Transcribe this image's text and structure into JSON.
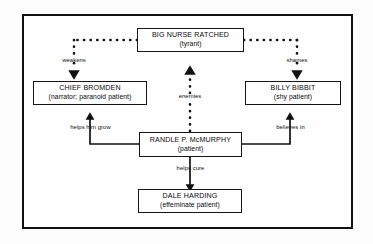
{
  "diagram": {
    "title_text": "",
    "frame": {
      "border_color": "#111111",
      "background": "#fefefe"
    },
    "nodes": [
      {
        "id": "big-nurse-ratched",
        "title": "BIG NURSE RATCHED",
        "sub": "(tyrant)"
      },
      {
        "id": "chief-bromden",
        "title": "CHIEF BROMDEN",
        "sub": "(narrator; paranoid patient)"
      },
      {
        "id": "billy-bibbit",
        "title": "BILLY BIBBIT",
        "sub": "(shy patient)"
      },
      {
        "id": "randle-p-mcmurphy",
        "title": "RANDLE P. McMURPHY",
        "sub": "(patient)"
      },
      {
        "id": "dale-harding",
        "title": "DALE HARDING",
        "sub": "(effeminate patient)"
      }
    ],
    "edges": [
      {
        "id": "nurse-weakens-chief",
        "label": "weakens",
        "from": "big-nurse-ratched",
        "to": "chief-bromden",
        "style": "dotted"
      },
      {
        "id": "nurse-shames-billy",
        "label": "shames",
        "from": "big-nurse-ratched",
        "to": "billy-bibbit",
        "style": "dotted"
      },
      {
        "id": "mcmurphy-enemies-nurse",
        "label": "enemies",
        "from": "randle-p-mcmurphy",
        "to": "big-nurse-ratched",
        "style": "dotted"
      },
      {
        "id": "mcmurphy-helps-chief",
        "label": "helps him grow",
        "from": "randle-p-mcmurphy",
        "to": "chief-bromden",
        "style": "solid"
      },
      {
        "id": "mcmurphy-believes-billy",
        "label": "believes in",
        "from": "randle-p-mcmurphy",
        "to": "billy-bibbit",
        "style": "solid"
      },
      {
        "id": "mcmurphy-cures-harding",
        "label": "helps cure",
        "from": "randle-p-mcmurphy",
        "to": "dale-harding",
        "style": "solid"
      }
    ]
  }
}
